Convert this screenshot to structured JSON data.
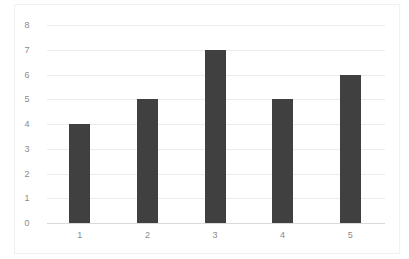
{
  "chart_data": {
    "type": "bar",
    "title": "",
    "xlabel": "",
    "ylabel": "",
    "categories": [
      "1",
      "2",
      "3",
      "4",
      "5"
    ],
    "values": [
      4,
      5,
      7,
      5,
      6
    ],
    "ylim": [
      0,
      8
    ],
    "yticks": [
      "0",
      "1",
      "2",
      "3",
      "4",
      "5",
      "6",
      "7",
      "8"
    ],
    "grid": true,
    "legend": null,
    "bar_color": "#404040"
  }
}
